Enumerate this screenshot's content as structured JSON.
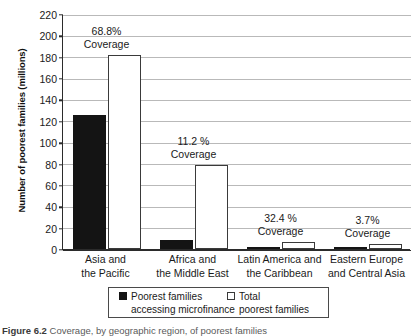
{
  "chart_data": {
    "type": "bar",
    "title": "",
    "xlabel": "",
    "ylabel": "Number of poorest families (millions)",
    "ylim": [
      0,
      220
    ],
    "ytick_step": 20,
    "yticks": [
      0,
      20,
      40,
      60,
      80,
      100,
      120,
      140,
      160,
      180,
      200,
      220
    ],
    "ytick_labels": [
      "0",
      "20",
      "40",
      "60",
      "80",
      "100",
      "120",
      "140",
      "160",
      "180",
      "200",
      "220"
    ],
    "grid": true,
    "legend_position": "bottom",
    "categories": [
      "Asia and the Pacific",
      "Africa and the Middle East",
      "Latin America and the Caribbean",
      "Eastern Europe and Central Asia"
    ],
    "category_lines": [
      [
        "Asia and",
        "the Pacific"
      ],
      [
        "Africa and",
        "the Middle East"
      ],
      [
        "Latin America and",
        "the Caribbean"
      ],
      [
        "Eastern Europe",
        "and Central Asia"
      ]
    ],
    "series": [
      {
        "name": "Poorest families accessing microfinance",
        "color": "#141414",
        "values": [
          125,
          8.8,
          2.3,
          0.2
        ]
      },
      {
        "name": "Total poorest families",
        "color": "#ffffff",
        "values": [
          182,
          79,
          7,
          5
        ]
      }
    ],
    "annotations": [
      {
        "percent": "68.8%",
        "label": "Coverage",
        "value": 68.8
      },
      {
        "percent": "11.2 %",
        "label": "Coverage",
        "value": 11.2
      },
      {
        "percent": "32.4 %",
        "label": "Coverage",
        "value": 32.4
      },
      {
        "percent": "3.7%",
        "label": "Coverage",
        "value": 3.7
      }
    ]
  },
  "legend": {
    "entries": [
      {
        "swatch": "dark",
        "line1": "Poorest families",
        "line2": "accessing microfinance"
      },
      {
        "swatch": "light",
        "line1": "Total",
        "line2": "poorest families"
      }
    ]
  },
  "caption": {
    "number": "Figure 6.2",
    "text": "Coverage, by geographic region, of poorest families"
  },
  "colors": {
    "bar_dark": "#141414",
    "bar_light": "#ffffff",
    "bar_light_border": "#3a3a3a",
    "axis": "#2b2b2b",
    "gridline": "#b9b9b9",
    "text": "#1a1a1a"
  }
}
